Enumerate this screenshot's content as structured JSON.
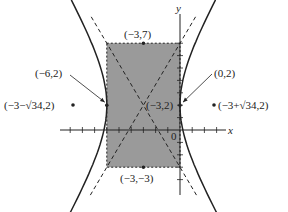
{
  "diagram": {
    "type": "hyperbola-sketch",
    "axes": {
      "x_label": "x",
      "y_label": "y",
      "origin_label": "0"
    },
    "center": {
      "x": -3,
      "y": 2
    },
    "rectangle": {
      "x_min": -6,
      "x_max": 0,
      "y_min": -3,
      "y_max": 7
    },
    "vertices": [
      {
        "x": -6,
        "y": 2
      },
      {
        "x": 0,
        "y": 2
      }
    ],
    "foci_labels": [
      "(−3−√34,2)",
      "(−3+√34,2)"
    ],
    "labels": {
      "top": "(−3,7)",
      "bottom": "(−3,−3)",
      "left_vertex": "(−6,2)",
      "right_vertex": "(0,2)",
      "center": "(−3,2)",
      "left_focus": "(−3−√34,2)",
      "right_focus": "(−3+√34,2)"
    },
    "colors": {
      "rect_fill": "#9a9a9a",
      "line": "#222222"
    }
  }
}
